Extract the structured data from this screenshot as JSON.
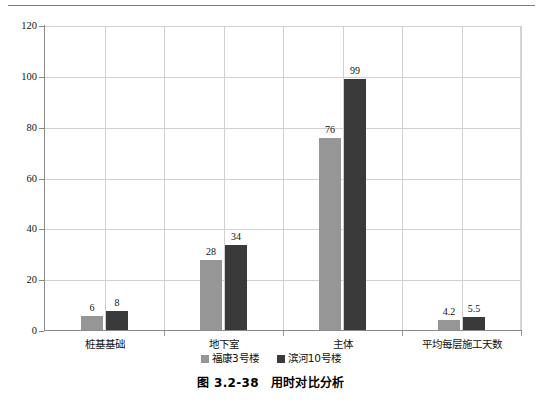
{
  "figure": {
    "caption_number": "图 3.2-38",
    "caption_title": "用时对比分析"
  },
  "chart_data": {
    "type": "bar",
    "title": "用时对比分析",
    "xlabel": "",
    "ylabel": "",
    "ylim": [
      0,
      120
    ],
    "yticks": [
      0,
      20,
      40,
      60,
      80,
      100,
      120
    ],
    "ytick_labels": [
      "0",
      "20",
      "40",
      "60",
      "80",
      "100",
      "120"
    ],
    "grid": true,
    "grid_axis": "both",
    "legend_position": "bottom-center",
    "categories": [
      "桩基基础",
      "地下室",
      "主体",
      "平均每层施工天数"
    ],
    "series": [
      {
        "name": "福康3号楼",
        "color": "#969696",
        "values": [
          6,
          28,
          76,
          4.2
        ],
        "value_labels": [
          "6",
          "28",
          "76",
          "4.2"
        ]
      },
      {
        "name": "滨河10号楼",
        "color": "#3a3a3a",
        "values": [
          8,
          34,
          99,
          5.5
        ],
        "value_labels": [
          "8",
          "34",
          "99",
          "5.5"
        ]
      }
    ]
  },
  "colors": {
    "series_light": "#969696",
    "series_dark": "#3a3a3a",
    "gridline": "#d0d0d0",
    "axis": "#8a8a8a",
    "rule": "#7d7d7d"
  }
}
